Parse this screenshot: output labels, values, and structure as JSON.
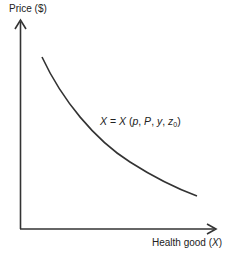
{
  "diagram": {
    "y_axis_label": "Price ($)",
    "x_axis_label_prefix": "Health good (",
    "x_axis_label_var": "X",
    "x_axis_label_suffix": ")",
    "curve_label": {
      "lhs": "X",
      "eq": " = ",
      "fn": "X",
      "open": " (",
      "p": "p",
      "c1": ", ",
      "P": "P",
      "c2": ", ",
      "y": "y",
      "c3": ", ",
      "z": "z",
      "z_sub": "0",
      "close": ")"
    },
    "curve_type": "downward-sloping demand curve",
    "colors": {
      "axis": "#333333",
      "curve": "#333333",
      "text": "#222222"
    }
  }
}
